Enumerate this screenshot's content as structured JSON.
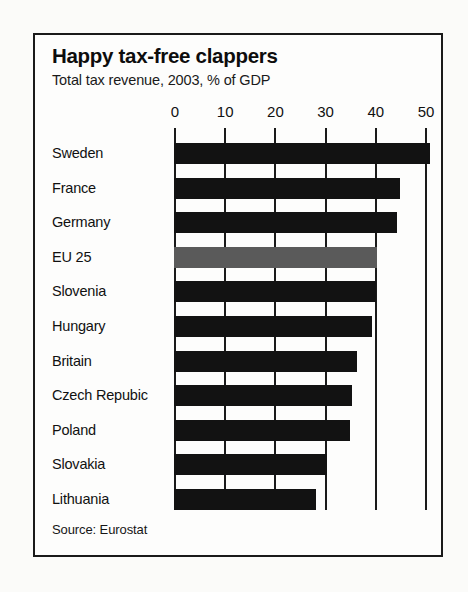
{
  "chart_data": {
    "type": "bar",
    "orientation": "horizontal",
    "title": "Happy tax-free clappers",
    "subtitle": "Total tax revenue, 2003, % of GDP",
    "xlabel": "",
    "ylabel": "",
    "xlim": [
      0,
      52
    ],
    "xticks": [
      0,
      10,
      20,
      30,
      40,
      50
    ],
    "xtick_labels": [
      "0",
      "10",
      "20",
      "30",
      "40",
      "50"
    ],
    "grid": true,
    "legend": false,
    "source": "Source: Eurostat",
    "categories": [
      "Sweden",
      "France",
      "Germany",
      "EU 25",
      "Slovenia",
      "Hungary",
      "Britain",
      "Czech Repubic",
      "Poland",
      "Slovakia",
      "Lithuania"
    ],
    "values": [
      51.0,
      45.0,
      44.5,
      40.5,
      40.3,
      39.5,
      36.5,
      35.5,
      35.0,
      30.5,
      28.3
    ],
    "highlight_category": "EU 25",
    "colors": {
      "bar": "#121212",
      "highlight_bar": "#5a5a5a",
      "frame": "#1a1a1a",
      "text": "#111111",
      "background": "#fdfdfc"
    }
  }
}
